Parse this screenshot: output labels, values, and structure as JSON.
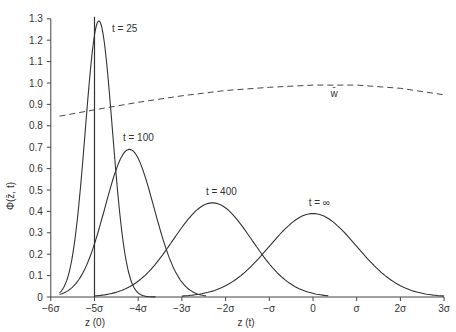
{
  "chart_data": {
    "type": "line",
    "title": "",
    "xlabel": "z (t)",
    "xlabel_secondary": "z (0)",
    "ylabel": "Φ(z̄, t)",
    "xlim": [
      -6,
      3
    ],
    "ylim": [
      0,
      1.3
    ],
    "grid": false,
    "x_ticks": [
      {
        "value": -6,
        "label": "−6σ"
      },
      {
        "value": -5,
        "label": "−5σ"
      },
      {
        "value": -4,
        "label": "−4σ"
      },
      {
        "value": -3,
        "label": "−3σ"
      },
      {
        "value": -2,
        "label": "−2σ"
      },
      {
        "value": -1,
        "label": "−σ"
      },
      {
        "value": 0,
        "label": "0"
      },
      {
        "value": 1,
        "label": "σ"
      },
      {
        "value": 2,
        "label": "2σ"
      },
      {
        "value": 3,
        "label": "3σ"
      }
    ],
    "y_ticks": [
      {
        "value": 0,
        "label": "0"
      },
      {
        "value": 0.1,
        "label": "0.1"
      },
      {
        "value": 0.2,
        "label": "0.2"
      },
      {
        "value": 0.3,
        "label": "0.3"
      },
      {
        "value": 0.4,
        "label": "0.4"
      },
      {
        "value": 0.5,
        "label": "0.5"
      },
      {
        "value": 0.6,
        "label": "0.6"
      },
      {
        "value": 0.7,
        "label": "0.7"
      },
      {
        "value": 0.8,
        "label": "0.8"
      },
      {
        "value": 0.9,
        "label": "0.9"
      },
      {
        "value": 1.0,
        "label": "1.0"
      },
      {
        "value": 1.1,
        "label": "1.1"
      },
      {
        "value": 1.2,
        "label": "1.2"
      },
      {
        "value": 1.3,
        "label": "1.3"
      }
    ],
    "series": [
      {
        "name": "t = 25",
        "shape": "gaussian",
        "peak_x": -4.9,
        "peak_y": 1.29,
        "sd": 0.31,
        "x_range": [
          -5.8,
          -3.6
        ],
        "style": "solid",
        "label_pos": [
          -4.6,
          1.24
        ]
      },
      {
        "name": "t = 100",
        "shape": "gaussian",
        "peak_x": -4.2,
        "peak_y": 0.69,
        "sd": 0.56,
        "x_range": [
          -5.8,
          -2.45
        ],
        "style": "solid",
        "label_pos": [
          -4.35,
          0.73
        ]
      },
      {
        "name": "t = 400",
        "shape": "gaussian",
        "peak_x": -2.3,
        "peak_y": 0.44,
        "sd": 0.9,
        "x_range": [
          -5.0,
          0.35
        ],
        "style": "solid",
        "label_pos": [
          -2.45,
          0.475
        ]
      },
      {
        "name": "t = ∞",
        "shape": "gaussian",
        "peak_x": 0.0,
        "peak_y": 0.39,
        "sd": 1.0,
        "x_range": [
          -3.0,
          3.0
        ],
        "style": "solid",
        "label_pos": [
          -0.1,
          0.425
        ]
      },
      {
        "name": "w̄",
        "shape": "quadratic",
        "x": [
          -5.8,
          -5,
          -4,
          -3,
          -2,
          -1,
          0,
          1,
          2,
          3
        ],
        "values": [
          0.845,
          0.875,
          0.91,
          0.94,
          0.965,
          0.98,
          0.99,
          0.99,
          0.975,
          0.945
        ],
        "style": "dashed",
        "label_pos": [
          0.4,
          0.935
        ]
      }
    ],
    "vertical_line": {
      "x": -5,
      "y_top": 1.31,
      "label": "z (0)"
    }
  }
}
